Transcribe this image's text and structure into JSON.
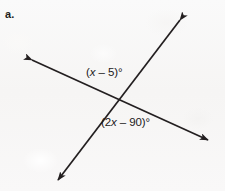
{
  "figure": {
    "item_letter": "a.",
    "background_color": "#f8f7f6",
    "line_color": "#231f20",
    "type": "intersecting-lines-angle-diagram",
    "intersection": {
      "x": 118,
      "y": 99
    },
    "lines": [
      {
        "name": "shallow-line",
        "from": {
          "x": 32,
          "y": 60,
          "arrow": true
        },
        "to": {
          "x": 208,
          "y": 140,
          "arrow": true
        }
      },
      {
        "name": "steep-line",
        "from": {
          "x": 180,
          "y": 20,
          "arrow": true
        },
        "to": {
          "x": 58,
          "y": 180,
          "arrow": true
        }
      }
    ],
    "angle_labels": [
      {
        "name": "upper-angle",
        "open_paren": "(",
        "variable": "x",
        "operator": " – 5",
        "close_paren": ")",
        "degree": "°",
        "full_text": "(x – 5)°",
        "position": {
          "x": 86,
          "y": 66
        }
      },
      {
        "name": "lower-angle",
        "open_paren": "(2",
        "variable": "x",
        "operator": " – 90",
        "close_paren": ")",
        "degree": "°",
        "full_text": "(2x – 90)°",
        "position": {
          "x": 101,
          "y": 116
        }
      }
    ]
  }
}
